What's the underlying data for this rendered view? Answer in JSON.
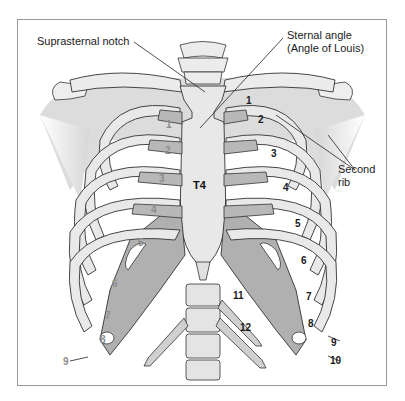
{
  "diagram": {
    "title_labels": {
      "suprasternal_notch": "Suprasternal notch",
      "sternal_angle_line1": "Sternal angle",
      "sternal_angle_line2": "(Angle of Louis)",
      "second_rib_line1": "Second",
      "second_rib_line2": "rib",
      "vertebra": "T4"
    },
    "right_side_rib_numbers": [
      "1",
      "2",
      "3",
      "4",
      "5",
      "6",
      "7",
      "8",
      "9",
      "10",
      "11",
      "12"
    ],
    "left_side_rib_numbers": [
      "1",
      "2",
      "3",
      "4",
      "5",
      "6",
      "7",
      "8",
      "9"
    ],
    "colors": {
      "bone": "#e6e6e6",
      "cartilage": "#b4b4b4",
      "costal_cartilage_dark": "#a9a9a9",
      "outline": "#333333",
      "shoulder_shade": "#d8d8d8",
      "frame": "#9a9a9a",
      "label_dark": "#1a1a1a",
      "label_grey": "#8c8c8c"
    }
  }
}
